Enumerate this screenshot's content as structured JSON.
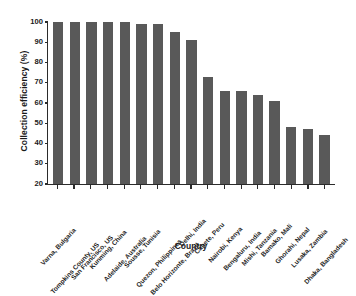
{
  "chart_data": {
    "type": "bar",
    "title": "",
    "xlabel": "Country",
    "ylabel": "Collection efficiency (%)",
    "ylim": [
      20,
      100
    ],
    "yticks": [
      20,
      30,
      40,
      50,
      60,
      70,
      80,
      90,
      100
    ],
    "grid": false,
    "legend": null,
    "bar_color": "#595959",
    "axis_color": "#2b2b2b",
    "background": "#ffffff",
    "categories": [
      "Varna, Bulgaria",
      "Tompkins County, US",
      "San Francisco, US",
      "Kunming, China",
      "Adelaide, Australia",
      "Sousse, Tunisia",
      "Quezon, Philippines",
      "Belo Horizonte, Brazil",
      "Delhi, India",
      "Canete, Peru",
      "Nairobi, Kenya",
      "Bengaluru, India",
      "Mishi, Tanzania",
      "Bamako, Mali",
      "Ghorahi, Nepal",
      "Lusaka, Zambia",
      "Dhaka, Bangladesh"
    ],
    "values": [
      100,
      100,
      100,
      100,
      100,
      99,
      99,
      95,
      91,
      73,
      66,
      66,
      64,
      61,
      48,
      47,
      44
    ]
  }
}
